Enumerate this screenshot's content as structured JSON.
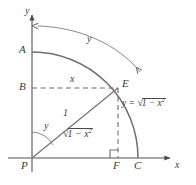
{
  "figure": {
    "background_color": "#ffffff",
    "stroke_color": "#6e6e6e",
    "text_color": "#3a3a3a",
    "axes": {
      "x_label": "x",
      "y_label": "y",
      "origin_label": "P"
    },
    "points": {
      "origin": "P",
      "arc_top": "A",
      "y_axis_foot": "B",
      "arc_point": "E",
      "x_axis_foot": "F",
      "arc_end": "C"
    },
    "labels": {
      "horizontal_dashed_segment": "x",
      "hypotenuse": "1",
      "angle_at_origin": "y",
      "arc_length": "y",
      "horizontal_leg_radicand": "1 − x",
      "horizontal_leg_radical_prefix": "√",
      "horizontal_leg_exponent": "2"
    },
    "curve_equation": {
      "lhs": "y =",
      "radical_prefix": "√",
      "radicand": "1 − x",
      "exponent": "2",
      "full_text": "y = √(1 − x²)"
    },
    "markers": {
      "right_angle_at_F": "right-angle-square"
    }
  }
}
